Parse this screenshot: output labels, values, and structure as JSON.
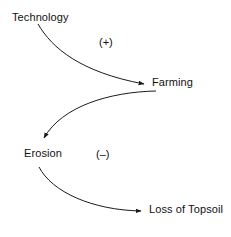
{
  "diagram": {
    "type": "causal-loop-diagram",
    "background_color": "#ffffff",
    "stroke_color": "#1a1a1a",
    "text_color": "#111111",
    "nodes": [
      {
        "id": "technology",
        "label": "Technology"
      },
      {
        "id": "farming",
        "label": "Farming"
      },
      {
        "id": "erosion",
        "label": "Erosion"
      },
      {
        "id": "topsoil",
        "label": "Loss of Topsoil"
      }
    ],
    "edges": [
      {
        "id": "technology-to-farming",
        "from": "Technology",
        "to": "Farming",
        "polarity": "(+)"
      },
      {
        "id": "farming-to-erosion",
        "from": "Farming",
        "to": "Erosion",
        "polarity": ""
      },
      {
        "id": "erosion-to-topsoil",
        "from": "Erosion",
        "to": "Loss of Topsoil",
        "polarity": "(–)"
      }
    ],
    "polarity_labels": {
      "plus": "(+)",
      "minus": "(–)"
    }
  }
}
